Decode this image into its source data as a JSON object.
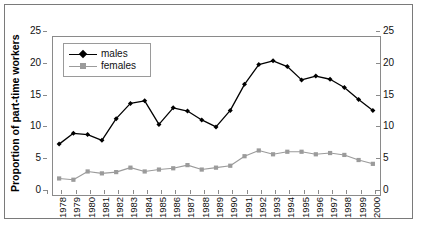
{
  "figure": {
    "caption": ""
  },
  "axes": {
    "y_title": "Proportion of part-time workers",
    "y_ticks": [
      0,
      5,
      10,
      15,
      20,
      25
    ],
    "y_ticks_right": [
      0,
      5,
      10,
      15,
      20,
      25
    ]
  },
  "legend": {
    "items": [
      {
        "label": "males",
        "marker": "diamond-marker",
        "color": "#000000"
      },
      {
        "label": "females",
        "marker": "square-marker",
        "color": "#9b9b9b"
      }
    ]
  },
  "chart_data": {
    "type": "line",
    "title": "",
    "xlabel": "",
    "ylabel": "Proportion of part-time workers",
    "ylim": [
      0,
      25
    ],
    "yticks": [
      0,
      5,
      10,
      15,
      20,
      25
    ],
    "grid": false,
    "legend_position": "upper-left-inside",
    "dual_axis": true,
    "categories": [
      "1978",
      "1979",
      "1980",
      "1981",
      "1982",
      "1983",
      "1984",
      "1985",
      "1986",
      "1987",
      "1988",
      "1989",
      "1990",
      "1991",
      "1992",
      "1993",
      "1994",
      "1995",
      "1996",
      "1997",
      "1998",
      "1999",
      "2000"
    ],
    "series": [
      {
        "name": "males",
        "color": "#000000",
        "marker": "diamond",
        "values": [
          8.0,
          9.7,
          9.5,
          8.6,
          12.0,
          14.4,
          14.8,
          11.1,
          13.7,
          13.2,
          11.8,
          10.7,
          13.3,
          17.4,
          20.5,
          21.1,
          20.2,
          18.1,
          18.7,
          18.2,
          16.9,
          15.0,
          13.3
        ]
      },
      {
        "name": "females",
        "color": "#9b9b9b",
        "marker": "square",
        "values": [
          2.6,
          2.4,
          3.7,
          3.4,
          3.6,
          4.3,
          3.7,
          4.0,
          4.2,
          4.7,
          4.0,
          4.3,
          4.6,
          6.1,
          7.0,
          6.4,
          6.8,
          6.8,
          6.4,
          6.6,
          6.3,
          5.5,
          4.9
        ]
      }
    ]
  }
}
